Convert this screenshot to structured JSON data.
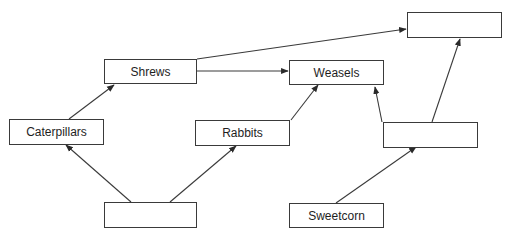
{
  "diagram": {
    "type": "food-web",
    "nodes": [
      {
        "id": "top_right_blank",
        "label": "",
        "x": 407,
        "y": 12,
        "w": 95,
        "h": 26
      },
      {
        "id": "shrews",
        "label": "Shrews",
        "x": 104,
        "y": 59,
        "w": 93,
        "h": 25
      },
      {
        "id": "weasels",
        "label": "Weasels",
        "x": 289,
        "y": 60,
        "w": 95,
        "h": 25
      },
      {
        "id": "caterpillars",
        "label": "Caterpillars",
        "x": 9,
        "y": 119,
        "w": 95,
        "h": 26
      },
      {
        "id": "rabbits",
        "label": "Rabbits",
        "x": 195,
        "y": 120,
        "w": 95,
        "h": 26
      },
      {
        "id": "right_middle_blank",
        "label": "",
        "x": 383,
        "y": 122,
        "w": 95,
        "h": 26
      },
      {
        "id": "bottom_blank",
        "label": "",
        "x": 104,
        "y": 202,
        "w": 93,
        "h": 26
      },
      {
        "id": "sweetcorn",
        "label": "Sweetcorn",
        "x": 289,
        "y": 203,
        "w": 95,
        "h": 25
      }
    ],
    "edges": [
      {
        "from": "bottom_blank",
        "to": "caterpillars",
        "x1": 131,
        "y1": 202,
        "x2": 66,
        "y2": 145
      },
      {
        "from": "bottom_blank",
        "to": "rabbits",
        "x1": 170,
        "y1": 202,
        "x2": 236,
        "y2": 146
      },
      {
        "from": "caterpillars",
        "to": "shrews",
        "x1": 69,
        "y1": 119,
        "x2": 114,
        "y2": 85
      },
      {
        "from": "shrews",
        "to": "weasels",
        "x1": 197,
        "y1": 71,
        "x2": 288,
        "y2": 71
      },
      {
        "from": "shrews",
        "to": "top_right_blank",
        "x1": 197,
        "y1": 59,
        "x2": 406,
        "y2": 29
      },
      {
        "from": "rabbits",
        "to": "weasels",
        "x1": 291,
        "y1": 120,
        "x2": 318,
        "y2": 85
      },
      {
        "from": "right_middle_blank",
        "to": "weasels",
        "x1": 382,
        "y1": 122,
        "x2": 375,
        "y2": 87
      },
      {
        "from": "right_middle_blank",
        "to": "top_right_blank",
        "x1": 432,
        "y1": 122,
        "x2": 460,
        "y2": 39
      },
      {
        "from": "sweetcorn",
        "to": "right_middle_blank",
        "x1": 336,
        "y1": 203,
        "x2": 416,
        "y2": 147
      }
    ],
    "colors": {
      "stroke": "#3a3a3a",
      "text": "#1e1e1e",
      "background": "#ffffff"
    }
  }
}
